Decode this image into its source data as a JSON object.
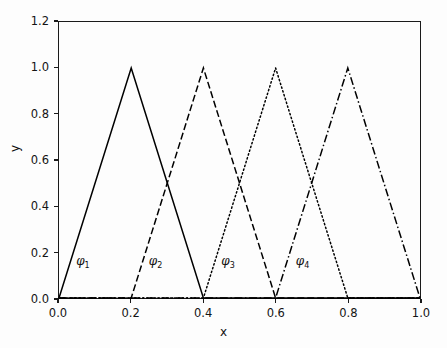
{
  "chart_data": {
    "type": "line",
    "title": "",
    "xlabel": "x",
    "ylabel": "y",
    "xlim": [
      0.0,
      1.0
    ],
    "ylim": [
      0.0,
      1.2
    ],
    "grid": false,
    "legend": "none (inline curve annotations)",
    "xticks": [
      "0.0",
      "0.2",
      "0.4",
      "0.6",
      "0.8",
      "1.0"
    ],
    "xtick_values": [
      0.0,
      0.2,
      0.4,
      0.6,
      0.8,
      1.0
    ],
    "yticks": [
      "0.0",
      "0.2",
      "0.4",
      "0.6",
      "0.8",
      "1.0",
      "1.2"
    ],
    "ytick_values": [
      0.0,
      0.2,
      0.4,
      0.6,
      0.8,
      1.0,
      1.2
    ],
    "x": [
      0.0,
      0.2,
      0.4,
      0.6,
      0.8,
      1.0
    ],
    "series": [
      {
        "name": "phi_1",
        "label": "φ",
        "subscript": "1",
        "linestyle": "solid",
        "color": "#000000",
        "values": [
          1.0,
          1.0,
          0.0,
          0.0,
          0.0,
          0.0
        ],
        "points": [
          [
            0.0,
            0.0
          ],
          [
            0.2,
            1.0
          ],
          [
            0.4,
            0.0
          ],
          [
            1.0,
            0.0
          ]
        ],
        "annotation_xy": [
          0.05,
          0.16
        ]
      },
      {
        "name": "phi_2",
        "label": "φ",
        "subscript": "2",
        "linestyle": "dashed",
        "color": "#000000",
        "values": [
          0.0,
          0.0,
          1.0,
          0.0,
          0.0,
          0.0
        ],
        "points": [
          [
            0.0,
            0.0
          ],
          [
            0.2,
            0.0
          ],
          [
            0.4,
            1.0
          ],
          [
            0.6,
            0.0
          ],
          [
            1.0,
            0.0
          ]
        ],
        "annotation_xy": [
          0.25,
          0.16
        ]
      },
      {
        "name": "phi_3",
        "label": "φ",
        "subscript": "3",
        "linestyle": "dotted",
        "color": "#000000",
        "values": [
          0.0,
          0.0,
          0.0,
          1.0,
          0.0,
          0.0
        ],
        "points": [
          [
            0.0,
            0.0
          ],
          [
            0.4,
            0.0
          ],
          [
            0.6,
            1.0
          ],
          [
            0.8,
            0.0
          ],
          [
            1.0,
            0.0
          ]
        ],
        "annotation_xy": [
          0.45,
          0.16
        ]
      },
      {
        "name": "phi_4",
        "label": "φ",
        "subscript": "4",
        "linestyle": "dashdot",
        "color": "#000000",
        "values": [
          0.0,
          0.0,
          0.0,
          0.0,
          1.0,
          0.0
        ],
        "points": [
          [
            0.0,
            0.0
          ],
          [
            0.6,
            0.0
          ],
          [
            0.8,
            1.0
          ],
          [
            1.0,
            0.0
          ]
        ],
        "annotation_xy": [
          0.655,
          0.16
        ]
      }
    ]
  }
}
